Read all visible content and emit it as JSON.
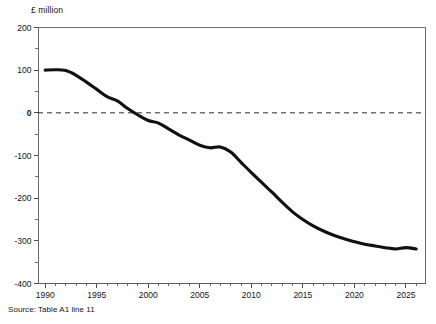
{
  "figure": {
    "unit_label": "£ million",
    "source_note": "Source: Table A1 line 11"
  },
  "chart_data": {
    "type": "line",
    "title": "",
    "subtitle": "",
    "xlabel": "",
    "ylabel": "£ million",
    "xlim": [
      1989.3,
      2026.9
    ],
    "ylim": [
      -400,
      200
    ],
    "grid": false,
    "legend": "none",
    "zero_reference_line": true,
    "y_major_ticks": [
      200,
      100,
      0,
      -100,
      -200,
      -300,
      -400
    ],
    "y_minor_tick_interval": 50,
    "y_tick_labels": [
      "200",
      "100",
      "0",
      "-100",
      "-200",
      "-300",
      "-400"
    ],
    "x_major_ticks": [
      1990,
      1995,
      2000,
      2005,
      2010,
      2015,
      2020,
      2025
    ],
    "x_tick_labels": [
      "1990",
      "1995",
      "2000",
      "2005",
      "2010",
      "2015",
      "2020",
      "2025"
    ],
    "x_minor_tick_interval": 1,
    "series": [
      {
        "name": "Table A1 line 11",
        "color": "#111111",
        "x": [
          1990,
          1991,
          1992,
          1993,
          1994,
          1995,
          1996,
          1997,
          1998,
          1999,
          2000,
          2001,
          2002,
          2003,
          2004,
          2005,
          2006,
          2007,
          2008,
          2009,
          2010,
          2011,
          2012,
          2013,
          2014,
          2015,
          2016,
          2017,
          2018,
          2019,
          2020,
          2021,
          2022,
          2023,
          2024,
          2025,
          2026
        ],
        "values": [
          100,
          101,
          99,
          88,
          72,
          55,
          38,
          28,
          10,
          -5,
          -18,
          -24,
          -38,
          -52,
          -64,
          -76,
          -82,
          -80,
          -92,
          -116,
          -140,
          -163,
          -186,
          -210,
          -232,
          -250,
          -265,
          -277,
          -287,
          -295,
          -302,
          -308,
          -312,
          -316,
          -319,
          -316,
          -319
        ]
      }
    ]
  }
}
